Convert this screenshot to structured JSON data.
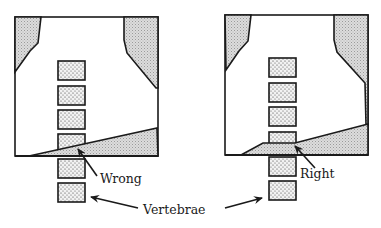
{
  "figure": {
    "colors": {
      "stroke": "#1a1a1a",
      "shade_fill": "#cfcfcf",
      "vertebra_fill": "#e6e6e6",
      "background": "#ffffff"
    },
    "panels": [
      {
        "id": "left",
        "label": "Wrong",
        "vertebrae_count": 6
      },
      {
        "id": "right",
        "label": "Right",
        "vertebrae_count": 6
      }
    ],
    "shared_label": "Vertebrae"
  }
}
